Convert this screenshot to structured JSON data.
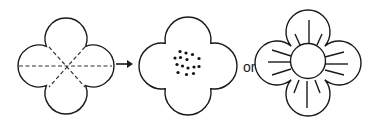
{
  "diagram": {
    "colors": {
      "line": "#1a1a1a",
      "background": "#ffffff",
      "dot": "#111111"
    },
    "flower_folded": {
      "center": [
        66,
        66
      ],
      "petal_radius": 21,
      "petal_offset": 27,
      "dashed_lines": [
        {
          "x1": 19,
          "y1": 66,
          "x2": 112,
          "y2": 66
        },
        {
          "x1": 49,
          "y1": 47,
          "x2": 85,
          "y2": 87
        },
        {
          "x1": 85,
          "y1": 47,
          "x2": 49,
          "y2": 87
        }
      ]
    },
    "arrow": {
      "x1": 116,
      "y1": 64,
      "x2": 133,
      "y2": 64,
      "icon": "right-arrow-icon"
    },
    "flower_dotted": {
      "center": [
        188,
        66
      ],
      "petal_radius": 23,
      "petal_offset": 26,
      "dots": [
        [
          180,
          51.5
        ],
        [
          186,
          53
        ],
        [
          192.5,
          54.5
        ],
        [
          175,
          58
        ],
        [
          180.5,
          57.5
        ],
        [
          187,
          59.5
        ],
        [
          199,
          58.5
        ],
        [
          177,
          64.5
        ],
        [
          182.5,
          66
        ],
        [
          188,
          68
        ],
        [
          194,
          67
        ],
        [
          199,
          66.5
        ],
        [
          178,
          72.5
        ],
        [
          186.5,
          74.5
        ],
        [
          193.5,
          73.5
        ]
      ],
      "dot_radius": 1.6
    },
    "connector_label": "or",
    "flower_rayed": {
      "center": [
        308,
        63
      ],
      "petal_radius": 22,
      "petal_offset": 31,
      "center_circle_radius": 17.5,
      "rays": [
        {
          "x1": 309,
          "y1": 20,
          "x2": 309,
          "y2": 43
        },
        {
          "x1": 295,
          "y1": 34,
          "x2": 300,
          "y2": 45
        },
        {
          "x1": 322,
          "y1": 34,
          "x2": 317,
          "y2": 45
        },
        {
          "x1": 268,
          "y1": 62,
          "x2": 290,
          "y2": 62
        },
        {
          "x1": 272,
          "y1": 50,
          "x2": 291,
          "y2": 56
        },
        {
          "x1": 272,
          "y1": 75,
          "x2": 291,
          "y2": 69
        },
        {
          "x1": 325,
          "y1": 64,
          "x2": 348,
          "y2": 64
        },
        {
          "x1": 325,
          "y1": 57,
          "x2": 344,
          "y2": 52
        },
        {
          "x1": 325,
          "y1": 70,
          "x2": 344,
          "y2": 75
        },
        {
          "x1": 307,
          "y1": 81,
          "x2": 307,
          "y2": 108
        },
        {
          "x1": 299,
          "y1": 80,
          "x2": 294,
          "y2": 93
        },
        {
          "x1": 315,
          "y1": 80,
          "x2": 320,
          "y2": 93
        }
      ]
    }
  }
}
